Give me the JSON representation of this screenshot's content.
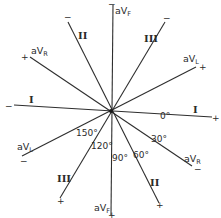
{
  "center": {
    "x": 111,
    "y": 111
  },
  "leads": [
    {
      "id": "I",
      "name": "Lead I",
      "neg_end": [
        14,
        105
      ],
      "pos_end": [
        212,
        117
      ],
      "neg_sign": "−",
      "pos_sign": "+",
      "label": "I",
      "label_alt": "I"
    },
    {
      "id": "aVF",
      "name": "aVF",
      "neg_end": [
        113,
        5
      ],
      "pos_end": [
        111,
        215
      ],
      "neg_sign": "−",
      "pos_sign": "+",
      "label_top": "aV",
      "label_top_sub": "F",
      "label_bottom": "aV",
      "label_bottom_sub": "F"
    },
    {
      "id": "aVR",
      "name": "aVR",
      "neg_end": [
        192,
        166
      ],
      "pos_end": [
        30,
        57
      ],
      "neg_sign": "−",
      "pos_sign": "+",
      "label_top": "aV",
      "label_top_sub": "R",
      "label_bottom": "aV",
      "label_bottom_sub": "R"
    },
    {
      "id": "aVL",
      "name": "aVL",
      "neg_end": [
        22,
        156
      ],
      "pos_end": [
        196,
        67
      ],
      "neg_sign": "−",
      "pos_sign": "+",
      "label_top": "aV",
      "label_top_sub": "L",
      "label_bottom": "aV",
      "label_bottom_sub": "L"
    },
    {
      "id": "II",
      "name": "Lead II",
      "neg_end": [
        68,
        22
      ],
      "pos_end": [
        159,
        203
      ],
      "neg_sign": "−",
      "pos_sign": "+",
      "label": "II",
      "label_alt": "II"
    },
    {
      "id": "III",
      "name": "Lead III",
      "neg_end": [
        165,
        22
      ],
      "pos_end": [
        60,
        198
      ],
      "neg_sign": "−",
      "pos_sign": "+",
      "label": "III",
      "label_alt": "III"
    }
  ],
  "angles": [
    {
      "label": "0°",
      "x": 160,
      "y": 119
    },
    {
      "label": "30°",
      "x": 151,
      "y": 142
    },
    {
      "label": "60°",
      "x": 134,
      "y": 158
    },
    {
      "label": "90°",
      "x": 112,
      "y": 162
    },
    {
      "label": "120°",
      "x": 91,
      "y": 150
    },
    {
      "label": "150°",
      "x": 76,
      "y": 137
    }
  ],
  "colors": {
    "ink": "#2e2e2e",
    "background": "#ffffff"
  }
}
